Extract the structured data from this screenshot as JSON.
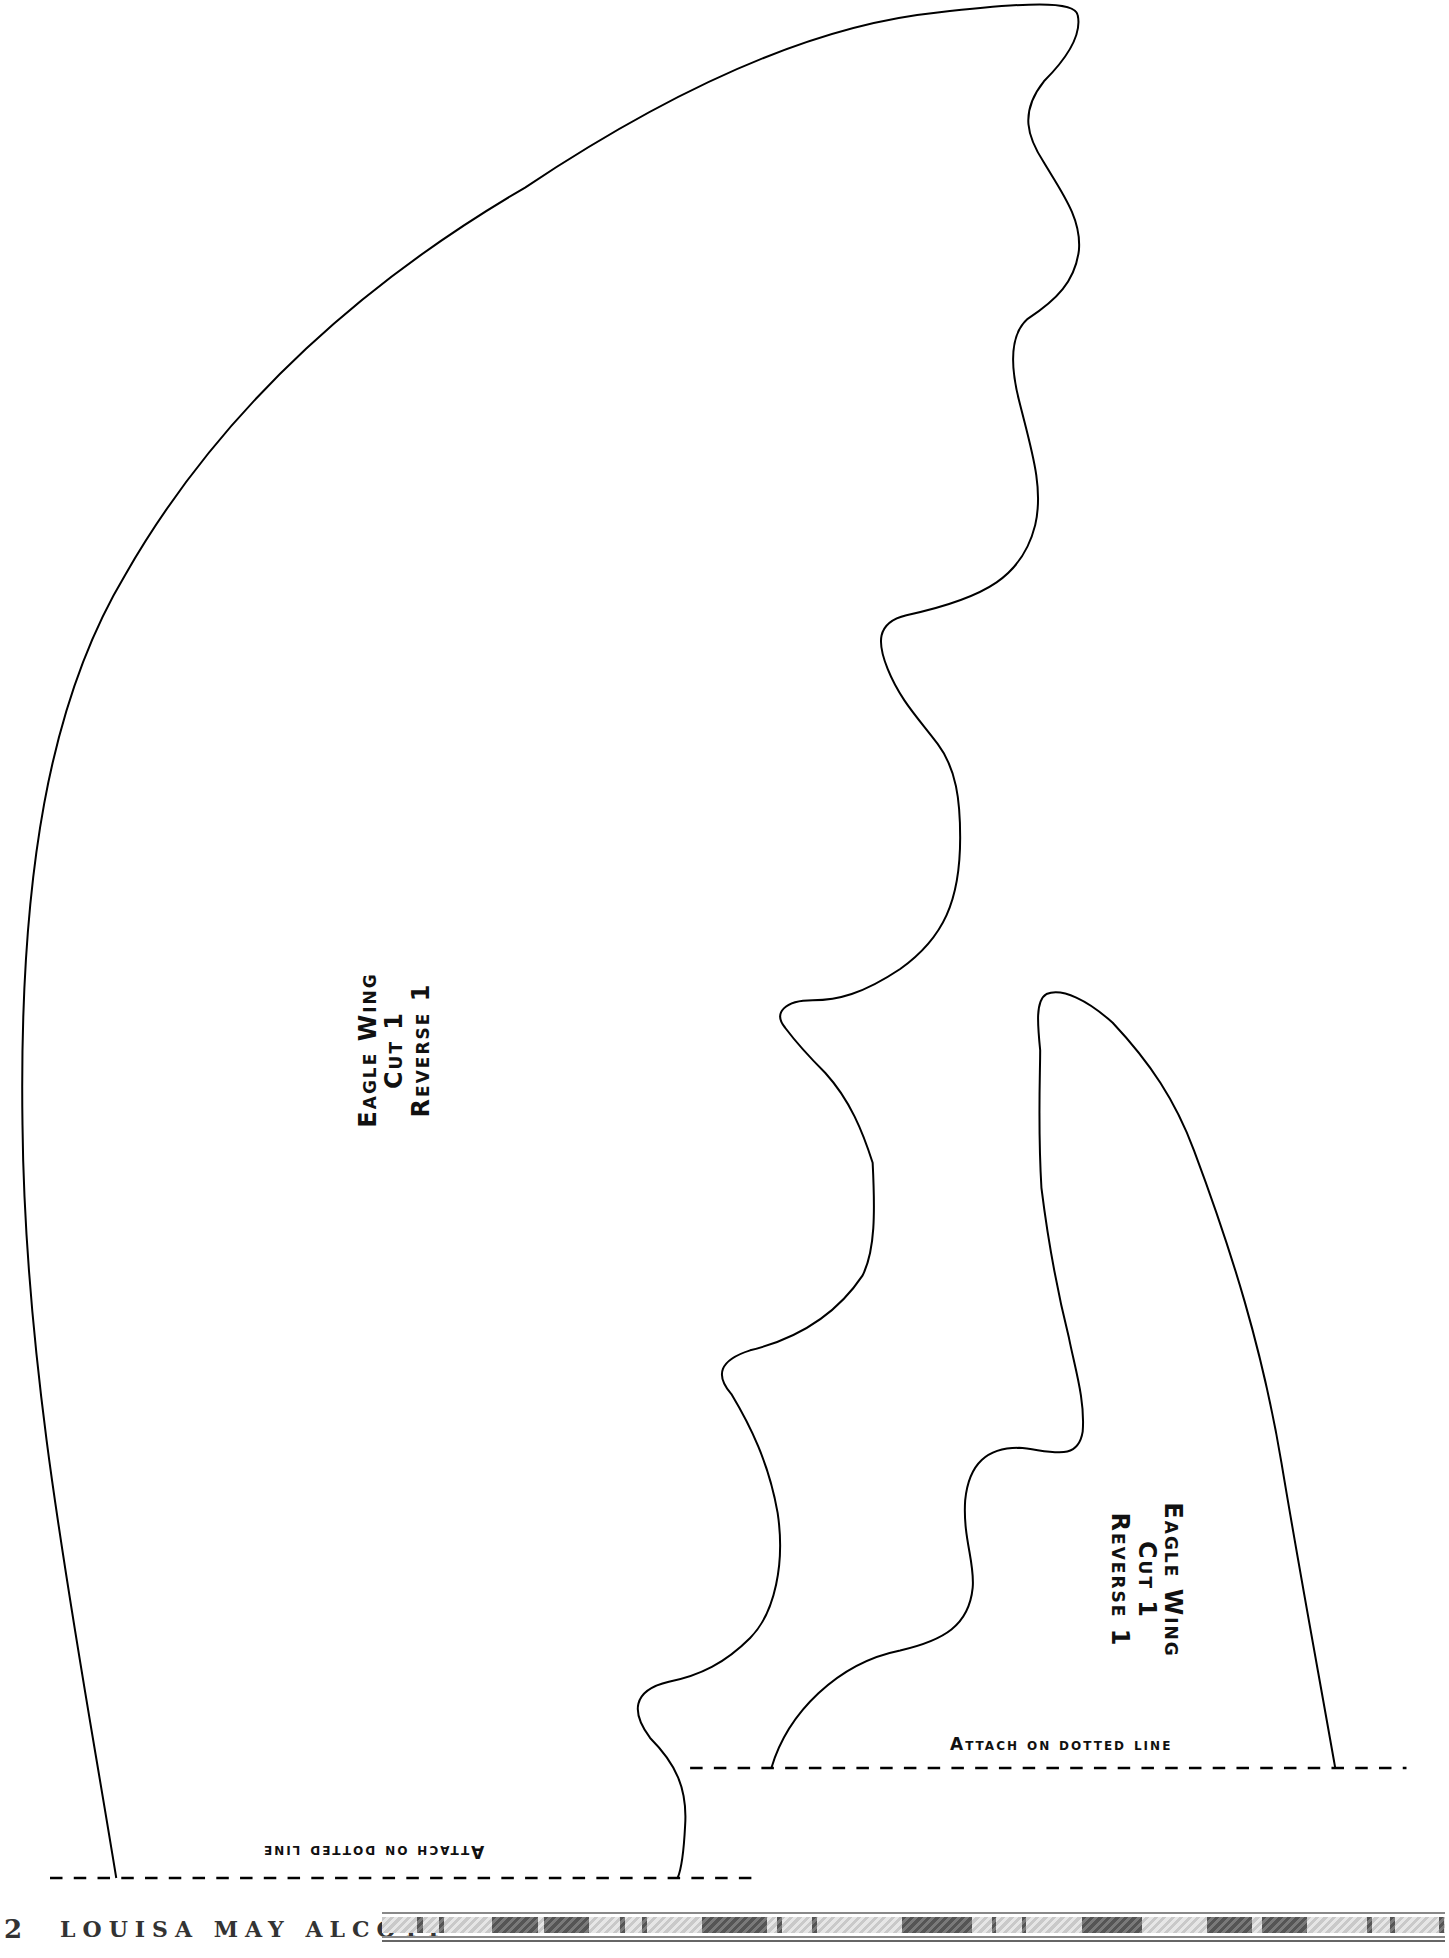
{
  "pieces": [
    {
      "name": "large-wing",
      "label": [
        "Eagle Wing",
        "Cut 1",
        "Reverse 1"
      ],
      "orientation": "rotated -90°",
      "attach_text": "Attach on dotted line",
      "attach_orientation": "upside down"
    },
    {
      "name": "small-wing",
      "label": [
        "Eagle Wing",
        "Cut 1",
        "Reverse 1"
      ],
      "orientation": "rotated 90°",
      "attach_text": "Attach on dotted line",
      "attach_orientation": "upright"
    }
  ],
  "footer": {
    "page_number": "2",
    "author": "LOUISA MAY ALCOTT"
  },
  "colors": {
    "outline": "#000000",
    "background": "#ffffff",
    "footer_text": "#333333"
  }
}
